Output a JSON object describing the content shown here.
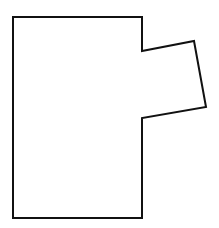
{
  "diagram": {
    "type": "polygon-outline",
    "stroke_color": "#111111",
    "fill_color": "#ffffff",
    "background": "#ffffff",
    "stroke_width": 2,
    "vertices": [
      [
        13,
        17
      ],
      [
        142,
        17
      ],
      [
        142,
        51
      ],
      [
        194,
        41
      ],
      [
        206,
        107
      ],
      [
        142,
        118
      ],
      [
        142,
        218
      ],
      [
        13,
        218
      ]
    ]
  }
}
